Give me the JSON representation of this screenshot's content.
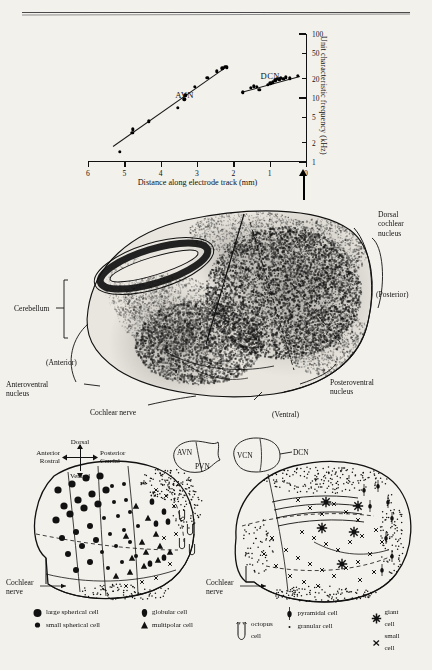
{
  "chart_data": {
    "type": "scatter",
    "title": "",
    "xlabel": "Distance along electrode track (mm)",
    "ylabel": "Unit characteristic frequency (kHz)",
    "xlim": [
      6,
      0
    ],
    "ylim": [
      1,
      100
    ],
    "yscale": "log",
    "xticks": [
      6,
      5,
      4,
      3,
      2,
      1,
      0
    ],
    "xticklabels": [
      "6",
      "5",
      "4",
      "3",
      "2",
      "1",
      "0"
    ],
    "yticks": [
      1,
      2,
      5,
      10,
      20,
      50,
      100
    ],
    "yticklabels": [
      "1",
      "2",
      "5",
      "10",
      "20",
      "50",
      "100"
    ],
    "grid": false,
    "legend": "inline-annotation",
    "series": [
      {
        "name": "AVN",
        "label": "AVN",
        "points": [
          {
            "x": 5.12,
            "y": 1.45
          },
          {
            "x": 4.78,
            "y": 2.85
          },
          {
            "x": 4.76,
            "y": 3.25
          },
          {
            "x": 4.32,
            "y": 4.3
          },
          {
            "x": 3.53,
            "y": 7.0
          },
          {
            "x": 3.35,
            "y": 9.6
          },
          {
            "x": 3.32,
            "y": 11.0
          },
          {
            "x": 3.06,
            "y": 15.0
          },
          {
            "x": 2.72,
            "y": 20.5
          },
          {
            "x": 2.45,
            "y": 26.0
          },
          {
            "x": 2.3,
            "y": 29.0
          },
          {
            "x": 2.22,
            "y": 31.0
          },
          {
            "x": 2.18,
            "y": 30.0
          }
        ],
        "fit": {
          "x1": 5.3,
          "y1": 1.75,
          "x2": 2.15,
          "y2": 31.5
        }
      },
      {
        "name": "DCN",
        "label": "DCN",
        "points": [
          {
            "x": 1.74,
            "y": 12.2
          },
          {
            "x": 1.52,
            "y": 14.4
          },
          {
            "x": 1.44,
            "y": 15.2
          },
          {
            "x": 1.36,
            "y": 15.0
          },
          {
            "x": 1.28,
            "y": 13.4
          },
          {
            "x": 1.05,
            "y": 16.0
          },
          {
            "x": 0.98,
            "y": 17.0
          },
          {
            "x": 0.92,
            "y": 17.6
          },
          {
            "x": 0.84,
            "y": 19.0
          },
          {
            "x": 0.8,
            "y": 20.0
          },
          {
            "x": 0.74,
            "y": 19.6
          },
          {
            "x": 0.7,
            "y": 20.6
          },
          {
            "x": 0.62,
            "y": 20.0
          },
          {
            "x": 0.56,
            "y": 21.0
          },
          {
            "x": 0.44,
            "y": 20.4
          },
          {
            "x": 0.22,
            "y": 22.0
          }
        ],
        "fit": {
          "x1": 1.8,
          "y1": 12.3,
          "x2": 0.18,
          "y2": 21.8
        }
      }
    ],
    "annotations": [
      {
        "text": "AVN",
        "x": 3.6,
        "y": 13.5
      },
      {
        "text": "DCN",
        "x": 1.25,
        "y": 26.0
      }
    ]
  },
  "section": {
    "labels": {
      "dorsal_cochlear_nucleus": "Dorsal\ncochlear\nnucleus",
      "dorsal_line1": "Dorsal",
      "dorsal_line2": "cochlear",
      "dorsal_line3": "nucleus",
      "posterior": "(Posterior)",
      "anterior": "(Anterior)",
      "ventral": "(Ventral)",
      "cerebellum": "Cerebellum",
      "anteroventral_line1": "Anteroventral",
      "anteroventral_line2": "nucleus",
      "posteroventral_line1": "Posteroventral",
      "posteroventral_line2": "nucleus",
      "cochlear_nerve": "Cochlear nerve"
    }
  },
  "cells": {
    "compass": {
      "dorsal": "Dorsal",
      "ventral": "Ventral",
      "anterior": "Anterior",
      "rostral": "Rostral",
      "posterior": "Posterior",
      "caudal": "Caudal"
    },
    "inset_left": {
      "avn": "AVN",
      "pvn": "PVN"
    },
    "inset_right": {
      "vcn": "VCN",
      "dcn": "DCN"
    },
    "nerve_left_line1": "Cochlear",
    "nerve_left_line2": "nerve",
    "nerve_right_line1": "Cochlear",
    "nerve_right_line2": "nerve",
    "legend": [
      {
        "symbol": "large-filled-circle",
        "label": "large spherical cell"
      },
      {
        "symbol": "small-filled-circle",
        "label": "small spherical cell"
      },
      {
        "symbol": "globular-shape",
        "label": "globular cell"
      },
      {
        "symbol": "filled-triangle",
        "label": "multipolar cell"
      },
      {
        "symbol": "octopus-shape",
        "label": "octopus cell"
      },
      {
        "symbol": "pyramidal-shape",
        "label": "pyramidal cell"
      },
      {
        "symbol": "tiny-dot",
        "label": "granular cell"
      },
      {
        "symbol": "star",
        "label": "giant cell"
      },
      {
        "symbol": "x-mark",
        "label": "small cell"
      }
    ]
  },
  "colors": {
    "ink": "#111111",
    "paper": "#f3f1ec",
    "tissue": "#e9e6df"
  }
}
